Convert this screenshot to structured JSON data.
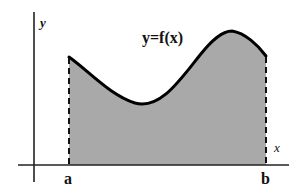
{
  "diagram": {
    "type": "area-under-curve",
    "function_label": "y=f(x)",
    "y_axis_label": "y",
    "x_axis_label": "x",
    "bounds": {
      "lower": "a",
      "upper": "b"
    },
    "colors": {
      "fill": "#a9a9a9",
      "curve": "#000000",
      "axes": "#222222",
      "bounds": "#111111",
      "background": "#ffffff"
    }
  }
}
